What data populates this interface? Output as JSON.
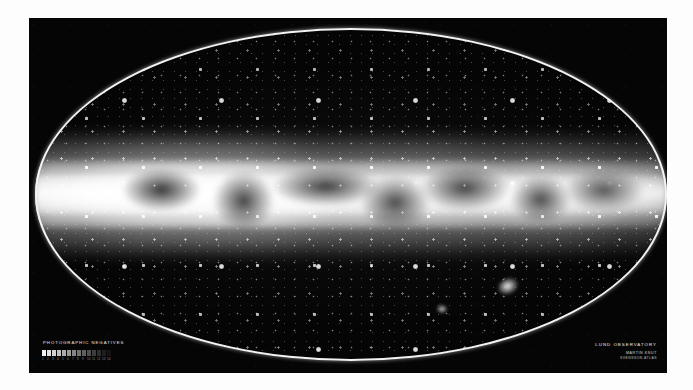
{
  "plate": {
    "background_color": "#050505",
    "outline_color": "#f3f3f3",
    "projection": "elliptical-equal-area"
  },
  "captions": {
    "left_label": "PHOTOGRAPHIC NEGATIVES",
    "right_title": "LUND OBSERVATORY",
    "right_line2": "MARTIN KNUT",
    "right_line3": "SVENSSON ATLAS"
  },
  "objects": {
    "milky_way_band": "galactic-plane-band",
    "large_magellanic_cloud": "LMC",
    "small_magellanic_cloud": "SMC"
  },
  "step_wedge": {
    "label": "greyscale-calibration-strip",
    "levels": [
      "#f2f2f2",
      "#e2e2e2",
      "#d2d2d2",
      "#c0c0c0",
      "#ababab",
      "#989898",
      "#858585",
      "#727272",
      "#606060",
      "#4e4e4e",
      "#3d3d3d",
      "#2d2d2d",
      "#1f1f1f",
      "#141414"
    ],
    "numbers": [
      "1",
      "2",
      "3",
      "4",
      "5",
      "6",
      "7",
      "8",
      "9",
      "10",
      "11",
      "12",
      "13",
      "14"
    ]
  }
}
